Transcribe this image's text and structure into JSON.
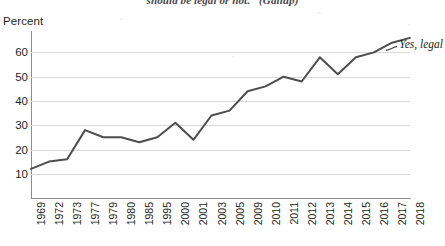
{
  "figure": {
    "title_fragment": "should be legal or not.\" (Gallup)",
    "axis_unit_label": "Percent",
    "series_annotation": "Yes, legal"
  },
  "colors": {
    "line": "#4d4d4d",
    "grid": "#d9d9d9",
    "axis": "#8c8c8c",
    "text": "#231f20",
    "background": "#ffffff"
  },
  "chart_data": {
    "type": "line",
    "title": "should be legal or not.\" (Gallup)",
    "xlabel": "",
    "ylabel": "Percent",
    "ylim": [
      0,
      68
    ],
    "yticks": [
      10,
      20,
      30,
      40,
      50,
      60
    ],
    "grid": true,
    "legend_position": "right-inline-annotation",
    "series": [
      {
        "name": "Yes, legal",
        "categories": [
          "1969",
          "1972",
          "1973",
          "1977",
          "1979",
          "1980",
          "1985",
          "1995",
          "2000",
          "2001",
          "2003",
          "2005",
          "2009",
          "2010",
          "2011",
          "2012",
          "2013",
          "2014",
          "2015",
          "2016",
          "2017",
          "2018"
        ],
        "values": [
          12,
          15,
          16,
          28,
          25,
          25,
          23,
          25,
          31,
          24,
          34,
          36,
          44,
          46,
          50,
          48,
          58,
          51,
          58,
          60,
          64,
          66
        ]
      }
    ],
    "annotations": [
      {
        "text": "Yes, legal",
        "attached_to": "2018",
        "position": "right"
      }
    ]
  }
}
